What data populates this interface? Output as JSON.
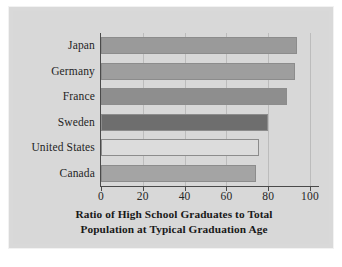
{
  "chart_data": {
    "type": "bar",
    "orientation": "horizontal",
    "title": "",
    "xlabel": "Ratio of High School Graduates to Total Population at Typical Graduation Age",
    "xlabel_lines": [
      "Ratio of High School Graduates to Total",
      "Population at Typical Graduation Age"
    ],
    "ylabel": "",
    "categories": [
      "Japan",
      "Germany",
      "France",
      "Sweden",
      "United States",
      "Canada"
    ],
    "values": [
      94,
      93,
      89,
      80,
      75.5,
      74
    ],
    "xlim": [
      0,
      100
    ],
    "xticks": [
      0,
      20,
      40,
      60,
      80,
      100
    ],
    "xtick_labels": [
      "0",
      "20",
      "40",
      "60",
      "80",
      "100"
    ],
    "grid": "vertical",
    "legend": "none",
    "bar_colors": [
      "#9a9a9a",
      "#9e9e9e",
      "#8e8e8e",
      "#6e6e6e",
      "#dcdcdc",
      "#a4a4a4"
    ],
    "bars": [
      {
        "label": "Japan",
        "value": 94,
        "color": "#9a9a9a"
      },
      {
        "label": "Germany",
        "value": 93,
        "color": "#9e9e9e"
      },
      {
        "label": "France",
        "value": 89,
        "color": "#8e8e8e"
      },
      {
        "label": "Sweden",
        "value": 80,
        "color": "#6e6e6e"
      },
      {
        "label": "United States",
        "value": 75.5,
        "color": "#dcdcdc"
      },
      {
        "label": "Canada",
        "value": 74,
        "color": "#a4a4a4"
      }
    ]
  },
  "figure": {
    "background_color": "#d8d8d8",
    "axis_color": "#4a4a4a",
    "grid_color": "#bcbcbc"
  }
}
